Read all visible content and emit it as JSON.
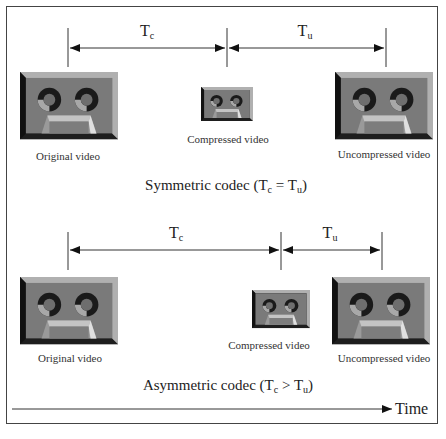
{
  "symmetric": {
    "interval_compress": {
      "main": "T",
      "sub": "c"
    },
    "interval_decompress": {
      "main": "T",
      "sub": "u"
    },
    "labels": [
      "Original video",
      "Compressed video",
      "Uncompressed video"
    ],
    "caption_prefix": "Symmetric codec (",
    "caption_op": " = ",
    "caption_suffix": ")"
  },
  "asymmetric": {
    "interval_compress": {
      "main": "T",
      "sub": "c"
    },
    "interval_decompress": {
      "main": "T",
      "sub": "u"
    },
    "labels": [
      "Original video",
      "Compressed video",
      "Uncompressed video"
    ],
    "caption_prefix": "Asymmetric codec (",
    "caption_op": " > ",
    "caption_suffix": ")"
  },
  "time_axis": {
    "label": "Time"
  },
  "colors": {
    "tape_face": "#7a7a7a",
    "tape_dark": "#1e1e1e",
    "tape_light": "#b8b8b8",
    "reel_light": "#a9a9a9"
  }
}
